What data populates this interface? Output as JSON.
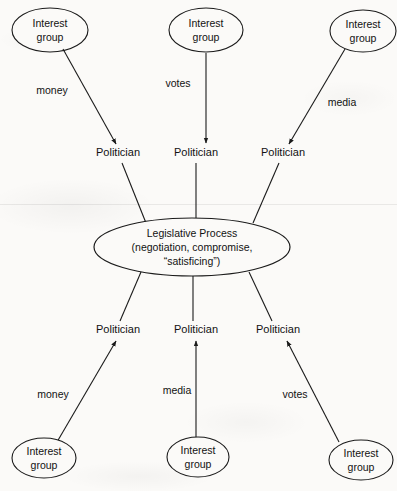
{
  "diagram": {
    "center": {
      "line1": "Legislative Process",
      "line2": "(negotiation, compromise,",
      "line3": "“satisficing”)"
    },
    "node_label": {
      "line1": "Interest",
      "line2": "group"
    },
    "politician_label": "Politician",
    "top_nodes": [
      {
        "id": "top-left",
        "label_line1": "Interest",
        "label_line2": "group"
      },
      {
        "id": "top-middle",
        "label_line1": "Interest",
        "label_line2": "group"
      },
      {
        "id": "top-right",
        "label_line1": "Interest",
        "label_line2": "group"
      }
    ],
    "bottom_nodes": [
      {
        "id": "bottom-left",
        "label_line1": "Interest",
        "label_line2": "group"
      },
      {
        "id": "bottom-middle",
        "label_line1": "Interest",
        "label_line2": "group"
      },
      {
        "id": "bottom-right",
        "label_line1": "Interest",
        "label_line2": "group"
      }
    ],
    "top_politicians": [
      {
        "id": "politician-top-left",
        "label": "Politician"
      },
      {
        "id": "politician-top-middle",
        "label": "Politician"
      },
      {
        "id": "politician-top-right",
        "label": "Politician"
      }
    ],
    "bottom_politicians": [
      {
        "id": "politician-bottom-left",
        "label": "Politician"
      },
      {
        "id": "politician-bottom-middle",
        "label": "Politician"
      },
      {
        "id": "politician-bottom-right",
        "label": "Politician"
      }
    ],
    "edge_labels": {
      "top_left": "money",
      "top_middle": "votes",
      "top_right": "media",
      "bottom_left": "money",
      "bottom_middle": "media",
      "bottom_right": "votes"
    },
    "colors": {
      "stroke": "#1b1b1b",
      "text": "#121212",
      "background": "#fbfaf8"
    }
  }
}
